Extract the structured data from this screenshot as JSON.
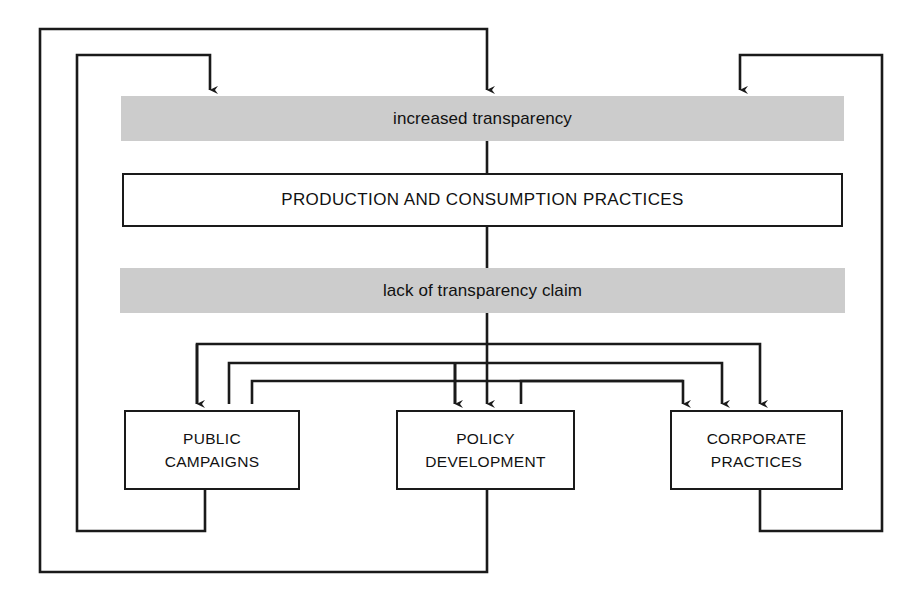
{
  "diagram": {
    "colors": {
      "band_fill": "#cccccc",
      "box_fill": "#ffffff",
      "stroke": "#1a1a1a",
      "text": "#111111",
      "background": "#ffffff"
    },
    "bands": [
      {
        "id": "increased-transparency",
        "label": "increased transparency",
        "style": "gray"
      },
      {
        "id": "production-and-consumption-practices",
        "label": "PRODUCTION AND CONSUMPTION PRACTICES",
        "style": "white"
      },
      {
        "id": "lack-of-transparency-claim",
        "label": "lack of transparency claim",
        "style": "gray"
      }
    ],
    "outcomes": [
      {
        "id": "public-campaigns",
        "line1": "PUBLIC",
        "line2": "CAMPAIGNS"
      },
      {
        "id": "policy-development",
        "line1": "POLICY",
        "line2": "DEVELOPMENT"
      },
      {
        "id": "corporate-practices",
        "line1": "CORPORATE",
        "line2": "PRACTICES"
      }
    ],
    "connectors": [
      {
        "id": "spine-transparency-to-practices",
        "from": "increased transparency",
        "to": "PRODUCTION AND CONSUMPTION PRACTICES",
        "kind": "line"
      },
      {
        "id": "spine-practices-to-claim",
        "from": "PRODUCTION AND CONSUMPTION PRACTICES",
        "to": "lack of transparency claim",
        "kind": "line"
      },
      {
        "id": "claim-to-public-campaigns",
        "from": "lack of transparency claim",
        "to": "PUBLIC CAMPAIGNS",
        "kind": "arrow"
      },
      {
        "id": "claim-to-policy-development",
        "from": "lack of transparency claim",
        "to": "POLICY DEVELOPMENT",
        "kind": "arrow"
      },
      {
        "id": "claim-to-corporate-practices",
        "from": "lack of transparency claim",
        "to": "CORPORATE PRACTICES",
        "kind": "arrow"
      },
      {
        "id": "public-campaigns-to-policy-development",
        "from": "PUBLIC CAMPAIGNS",
        "to": "POLICY DEVELOPMENT",
        "kind": "arrow"
      },
      {
        "id": "public-campaigns-to-corporate-practices",
        "from": "PUBLIC CAMPAIGNS",
        "to": "CORPORATE PRACTICES",
        "kind": "arrow"
      },
      {
        "id": "policy-development-to-public-campaigns",
        "from": "POLICY DEVELOPMENT",
        "to": "PUBLIC CAMPAIGNS",
        "kind": "arrow"
      },
      {
        "id": "policy-development-to-corporate-practices",
        "from": "POLICY DEVELOPMENT",
        "to": "CORPORATE PRACTICES",
        "kind": "arrow"
      },
      {
        "id": "corporate-practices-to-public-campaigns",
        "from": "CORPORATE PRACTICES",
        "to": "PUBLIC CAMPAIGNS",
        "kind": "arrow"
      },
      {
        "id": "corporate-practices-to-policy-development",
        "from": "CORPORATE PRACTICES",
        "to": "POLICY DEVELOPMENT",
        "kind": "arrow"
      },
      {
        "id": "feedback-public-campaigns-to-increased-transparency",
        "from": "PUBLIC CAMPAIGNS",
        "to": "increased transparency",
        "kind": "feedback-arrow"
      },
      {
        "id": "feedback-policy-development-to-increased-transparency",
        "from": "POLICY DEVELOPMENT",
        "to": "increased transparency",
        "kind": "feedback-arrow"
      },
      {
        "id": "feedback-corporate-practices-to-increased-transparency",
        "from": "CORPORATE PRACTICES",
        "to": "increased transparency",
        "kind": "feedback-arrow"
      }
    ]
  }
}
